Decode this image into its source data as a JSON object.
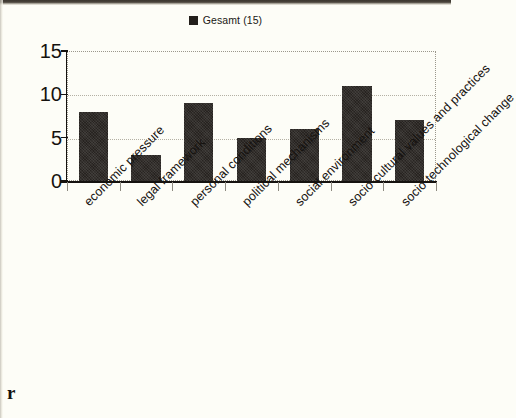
{
  "legend": {
    "marker_icon": "filled-square-icon",
    "label": "Gesamt (15)",
    "color": "#231f1b"
  },
  "artifacts": {
    "corner_letter": "r"
  },
  "axes": {
    "y_ticks": [
      "0",
      "5",
      "10",
      "15"
    ],
    "x_tick_count": 8
  },
  "chart_data": {
    "type": "bar",
    "title": "",
    "subtitle": "",
    "xlabel": "",
    "ylabel": "",
    "ylim": [
      0,
      15
    ],
    "yticks": [
      0,
      5,
      10,
      15
    ],
    "grid": true,
    "legend_position": "top-center",
    "categories": [
      "economic pressure",
      "legal framework",
      "personal conditions",
      "political mechanisms",
      "social environment",
      "socio-cultural values and practices",
      "socio-technological change"
    ],
    "series": [
      {
        "name": "Gesamt (15)",
        "color": "#272320",
        "values": [
          8,
          3,
          9,
          5,
          6,
          11,
          7
        ]
      }
    ]
  }
}
